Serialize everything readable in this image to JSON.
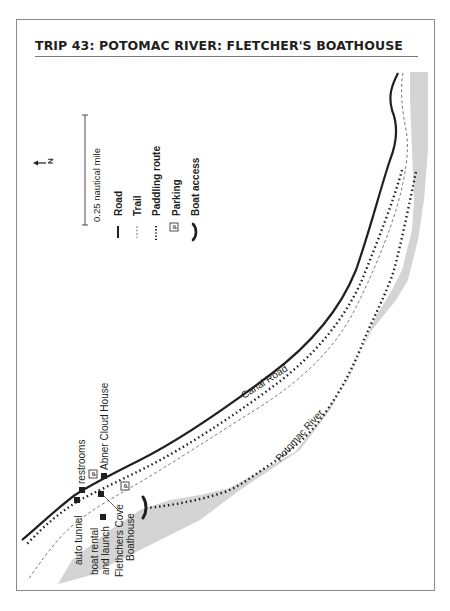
{
  "title": "TRIP 43: POTOMAC RIVER: FLETCHER'S BOATHOUSE",
  "north_arrow": {
    "label": "N",
    "icon": "north-arrow-icon"
  },
  "scale_bar": {
    "label": "0.25 nautical mile"
  },
  "legend": {
    "items": [
      {
        "icon": "road-line-icon",
        "label": "Road"
      },
      {
        "icon": "trail-dashed-line-icon",
        "label": "Trail"
      },
      {
        "icon": "paddling-route-dotted-icon",
        "label": "Paddling route"
      },
      {
        "icon": "parking-icon",
        "symbol": "P",
        "label": "Parking"
      },
      {
        "icon": "boat-access-icon",
        "label": "Boat access"
      }
    ]
  },
  "map_labels": {
    "road": "Canal Road",
    "river": "Potomac River",
    "restrooms": "restrooms",
    "abner": "Abner Cloud House",
    "tunnel": "auto tunnel",
    "rental_1": "boat rental",
    "rental_2": "and launch",
    "cove_1": "Flethchers Cove",
    "cove_2": "Boathouse",
    "parking_symbol": "P"
  },
  "colors": {
    "river": "#d4d4d4",
    "ink": "#231f20",
    "frame": "#8a8a8a"
  }
}
